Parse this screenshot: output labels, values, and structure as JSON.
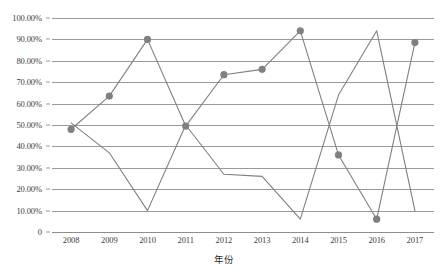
{
  "chart_data": {
    "type": "line",
    "title": "",
    "xlabel": "年份",
    "ylabel": "",
    "categories": [
      "2008",
      "2009",
      "2010",
      "2011",
      "2012",
      "2013",
      "2014",
      "2015",
      "2016",
      "2017"
    ],
    "x": [
      2008,
      2009,
      2010,
      2011,
      2012,
      2013,
      2014,
      2015,
      2016,
      2017
    ],
    "ylim": [
      0,
      1.0
    ],
    "y_tick_labels": [
      "100.00%",
      "90.00%",
      "80.00%",
      "70.00%",
      "60.00%",
      "50.00%",
      "40.00%",
      "30.00%",
      "20.00%",
      "10.00%",
      "0"
    ],
    "y_tick_values": [
      1.0,
      0.9,
      0.8,
      0.7,
      0.6,
      0.5,
      0.4,
      0.3,
      0.2,
      0.1,
      0
    ],
    "grid": true,
    "grid_axis": "y",
    "legend": "none",
    "series": [
      {
        "name": "series-1",
        "markers": true,
        "marker_shape": "circle",
        "color": "#808080",
        "values": [
          0.48,
          0.635,
          0.9,
          0.495,
          0.735,
          0.76,
          0.94,
          0.36,
          0.06,
          0.885
        ]
      },
      {
        "name": "series-2",
        "markers": false,
        "color": "#808080",
        "values": [
          0.51,
          0.37,
          0.1,
          0.5,
          0.27,
          0.26,
          0.06,
          0.64,
          0.94,
          0.1
        ]
      }
    ]
  },
  "colors": {
    "line": "#808080",
    "marker": "#808080",
    "grid": "#9a9a9a",
    "text": "#3d3d3d",
    "background": "#ffffff"
  }
}
